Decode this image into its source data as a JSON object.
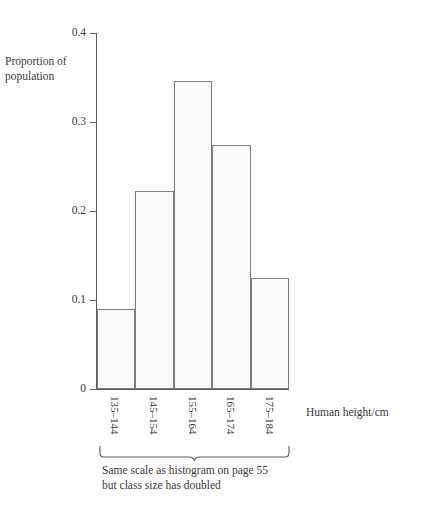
{
  "chart_data": {
    "type": "bar",
    "title": "",
    "subtitle": "",
    "xlabel": "Human height/cm",
    "ylabel": "Proportion of population",
    "categories": [
      "135–144",
      "145–154",
      "155–164",
      "165–174",
      "175–184"
    ],
    "values": [
      0.09,
      0.222,
      0.346,
      0.274,
      0.125
    ],
    "ylim": [
      0,
      0.4
    ],
    "ytick_labels": [
      "0",
      "0.1",
      "0.2",
      "0.3",
      "0.4"
    ],
    "ytick_values": [
      0,
      0.1,
      0.2,
      0.3,
      0.4
    ],
    "grid": false,
    "legend": null,
    "annotation": "Same scale as histogram on page 55 but class size has doubled"
  },
  "axes": {
    "y_title_line1": "Proportion of",
    "y_title_line2": "population",
    "x_title": "Human height/cm"
  },
  "annotation": {
    "line1": "Same scale as histogram on page 55",
    "line2": "but class size has doubled"
  },
  "colors": {
    "bar_fill": "#fafafa",
    "bar_stroke": "#7d7d7d",
    "axis": "#5b5b5b",
    "text": "#3a3a3a",
    "background": "#ffffff"
  }
}
